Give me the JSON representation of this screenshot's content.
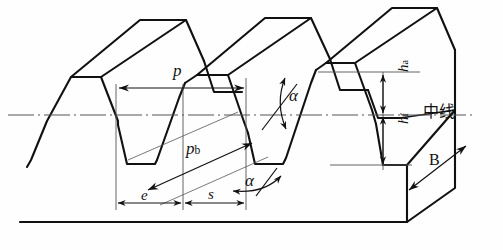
{
  "figure": {
    "kind": "engineering-diagram",
    "background_color": "#fefefe",
    "line_color": "#111111",
    "thin_line_color": "#444444"
  },
  "labels": {
    "pitch": "p",
    "base_pitch_main": "p",
    "base_pitch_sub": "b",
    "addendum_main": "h",
    "addendum_sub": "a",
    "dedendum_main": "h",
    "dedendum_sub": "f",
    "space_width": "e",
    "tooth_thickness": "s",
    "pressure_angle_upper": "α",
    "pressure_angle_lower": "α",
    "face_width": "B",
    "centerline": "中线"
  },
  "annotations": [
    {
      "name": "pitch-dimension",
      "symbol": "p",
      "meaning": "pitch",
      "orientation": "horizontal",
      "arrows": "both"
    },
    {
      "name": "base-pitch-dimension",
      "symbol": "pb",
      "meaning": "base pitch",
      "orientation": "diagonal",
      "arrows": "both"
    },
    {
      "name": "addendum-dimension",
      "symbol": "ha",
      "meaning": "addendum height",
      "orientation": "vertical",
      "arrows": "both"
    },
    {
      "name": "dedendum-dimension",
      "symbol": "hf",
      "meaning": "dedendum height",
      "orientation": "vertical",
      "arrows": "both"
    },
    {
      "name": "space-width-dimension",
      "symbol": "e",
      "meaning": "space width",
      "orientation": "horizontal",
      "arrows": "both"
    },
    {
      "name": "tooth-thickness-dimension",
      "symbol": "s",
      "meaning": "tooth thickness",
      "orientation": "horizontal",
      "arrows": "both"
    },
    {
      "name": "face-width-dimension",
      "symbol": "B",
      "meaning": "face width",
      "orientation": "diagonal",
      "arrows": "both"
    },
    {
      "name": "pressure-angle-upper",
      "symbol": "α",
      "meaning": "pressure angle",
      "marker": "curved-double-arrow"
    },
    {
      "name": "pressure-angle-lower",
      "symbol": "α",
      "meaning": "pressure angle",
      "marker": "curved-double-arrow"
    },
    {
      "name": "centerline",
      "symbol": "中线",
      "meaning": "pitch line / centre line",
      "style": "dash-dot"
    }
  ]
}
